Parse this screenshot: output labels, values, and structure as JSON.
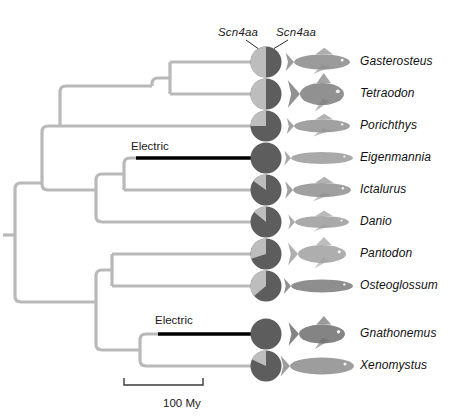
{
  "figure": {
    "type": "phylogenetic-tree-with-pie-charts",
    "gene_labels": [
      {
        "text": "Scn4aa",
        "x": 218,
        "y": 26
      },
      {
        "text": "Scn4aa",
        "x": 276,
        "y": 26
      }
    ],
    "electric_labels": [
      {
        "text": "Electric",
        "x": 131,
        "y": 140
      },
      {
        "text": "Electric",
        "x": 155,
        "y": 314
      }
    ],
    "scale_bar": {
      "label": "100 My",
      "x1": 124,
      "x2": 203,
      "y": 385,
      "tick_height": 7,
      "label_x": 163,
      "label_y": 397
    },
    "colors": {
      "branch": "#b9b9b9",
      "electric_branch": "#000000",
      "pie_dark": "#5d5d5d",
      "pie_light": "#bdbdbd",
      "text": "#101010",
      "background": "#ffffff"
    },
    "pie_radius": 15.5,
    "pie_center_x": 266,
    "taxa": [
      {
        "name": "Gasterosteus",
        "y": 62,
        "pie_light_fraction": 0.5,
        "electric": false,
        "branch_x": 170,
        "label_x": 360
      },
      {
        "name": "Tetraodon",
        "y": 94,
        "pie_light_fraction": 0.5,
        "electric": false,
        "branch_x": 170,
        "label_x": 360
      },
      {
        "name": "Porichthys",
        "y": 126,
        "pie_light_fraction": 0.25,
        "electric": false,
        "branch_x": 152,
        "label_x": 360
      },
      {
        "name": "Eigenmannia",
        "y": 158,
        "pie_light_fraction": 0.0,
        "electric": true,
        "branch_x": 136,
        "label_x": 360
      },
      {
        "name": "Ictalurus",
        "y": 190,
        "pie_light_fraction": 0.15,
        "electric": false,
        "branch_x": 124,
        "label_x": 360
      },
      {
        "name": "Danio",
        "y": 222,
        "pie_light_fraction": 0.14,
        "electric": false,
        "branch_x": 112,
        "label_x": 360
      },
      {
        "name": "Pantodon",
        "y": 254,
        "pie_light_fraction": 0.3,
        "electric": false,
        "branch_x": 112,
        "label_x": 360
      },
      {
        "name": "Osteoglossum",
        "y": 286,
        "pie_light_fraction": 0.36,
        "electric": false,
        "branch_x": 112,
        "label_x": 360
      },
      {
        "name": "Gnathonemus",
        "y": 334,
        "pie_light_fraction": 0.0,
        "electric": true,
        "branch_x": 158,
        "label_x": 360
      },
      {
        "name": "Xenomystus",
        "y": 366,
        "pie_light_fraction": 0.18,
        "electric": false,
        "branch_x": 158,
        "label_x": 360
      }
    ],
    "nodes": [
      {
        "id": "root",
        "x": 15,
        "y": 235
      },
      {
        "id": "n-teleost",
        "x": 42,
        "y": 183
      },
      {
        "id": "n-otophysi-clade",
        "x": 60,
        "y": 126
      },
      {
        "id": "n-percomorph",
        "x": 152,
        "y": 86
      },
      {
        "id": "n-gast-tetra",
        "x": 170,
        "y": 78
      },
      {
        "id": "n-ostariophysi",
        "x": 96,
        "y": 190
      },
      {
        "id": "n-eig-ict",
        "x": 124,
        "y": 174
      },
      {
        "id": "n-osteoglossomorph",
        "x": 96,
        "y": 302
      },
      {
        "id": "n-panto-osteo",
        "x": 112,
        "y": 270
      },
      {
        "id": "n-gnath-xeno",
        "x": 140,
        "y": 350
      }
    ]
  }
}
